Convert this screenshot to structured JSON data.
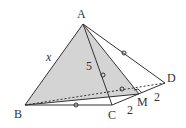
{
  "figure": {
    "points": {
      "A": "A",
      "B": "B",
      "C": "C",
      "D": "D",
      "M": "M"
    },
    "labels": {
      "AB": "x",
      "AM": "5",
      "CM": "2",
      "MD": "2"
    },
    "colors": {
      "shade": "#d4d4d4",
      "line": "#333333"
    }
  }
}
